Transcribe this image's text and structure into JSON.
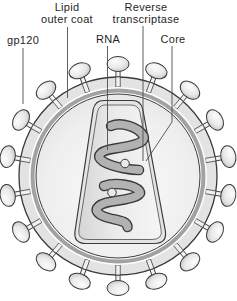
{
  "figure_type": "labeled-diagram",
  "background": "#ffffff",
  "diagram": {
    "labels": {
      "gp120": {
        "text": "gp120"
      },
      "lipid_outer_coat": {
        "line1": "Lipid",
        "line2": "outer coat"
      },
      "rna": {
        "text": "RNA"
      },
      "reverse_transcriptase": {
        "line1": "Reverse",
        "line2": "transcriptase"
      },
      "core": {
        "text": "Core"
      }
    },
    "leader_lines": [
      {
        "name": "gp120-line",
        "points": [
          [
            23,
            48
          ],
          [
            23,
            104
          ]
        ]
      },
      {
        "name": "lipid-outer-coat-line",
        "points": [
          [
            67.5,
            27
          ],
          [
            67.5,
            98
          ]
        ]
      },
      {
        "name": "rna-line",
        "points": [
          [
            107.5,
            46
          ],
          [
            107.5,
            150
          ]
        ]
      },
      {
        "name": "reverse-transcriptase-line",
        "points": [
          [
            143,
            26
          ],
          [
            143,
            161
          ]
        ]
      },
      {
        "name": "core-line",
        "points": [
          [
            172,
            46
          ],
          [
            172,
            122
          ],
          [
            146,
            161
          ]
        ]
      }
    ],
    "virion": {
      "center": [
        118,
        176
      ],
      "envelope_outer_radius": 99,
      "band_inner_radius": 89,
      "lipid_ring_outer_radius": 87.5,
      "lipid_ring_inner_radius": 83.5,
      "matrix_radius": 82,
      "spike_count": 18,
      "spike_angle_step_deg": 20,
      "spike_head_center_radius": 112,
      "spike_head_rx": 11,
      "spike_head_ry": 7.5,
      "stalk_span": [
        97,
        105.5
      ],
      "stalk_width": 4.2,
      "divider_span": [
        89,
        99
      ],
      "divider_width": 4.4
    },
    "core_capsid": {
      "outer_path": "M104,100.5 L132,100.5 Q141,100.5 142.8,109.5 L165.2,230 Q167.8,243.5 154,243.5 L86,243.5 Q72.8,243.5 75.2,230 L93.2,109.5 Q95,100.5 104,100.5 Z",
      "inner_path": "M105,105 L131,105 Q138.5,105 140,112.5 L161,229 Q163.2,239.5 152,239.5 L88,239.5 Q77,239.5 79,229 L97.3,112.5 Q98.8,105 105,105 Z"
    },
    "rna_strands": [
      "M111,126 C121,121.5 139,127 143.5,136 C146.5,143.5 129,146.5 115,148.5 C97,151 94.5,158 107,163.5 C116,167.5 131,170 139,170",
      "M104,186 C115,182 134,184.5 139.5,191 C143,196.5 127,199.5 112,201.5 C95.5,204 91.5,211.5 104,216.5 C114,220.5 127,219.5 127.5,227"
    ],
    "rt_balls": [
      {
        "cx": 125,
        "cy": 163.5,
        "r": 4.3
      },
      {
        "cx": 112,
        "cy": 192.5,
        "r": 4.3
      }
    ],
    "colors": {
      "outline": "#3a3a3a",
      "leader_line": "#4d4d4d",
      "envelope_band": "#e3e3e3",
      "lipid_ring": "#a2a2a2",
      "gap_white": "#ffffff",
      "core_shell": "#e4e4e4",
      "rna_fill": "#b2b2b2",
      "rna_outline": "#3a3a3a",
      "ball_fill": "#e9e9e9",
      "label_color": "#1f1f1f"
    }
  }
}
